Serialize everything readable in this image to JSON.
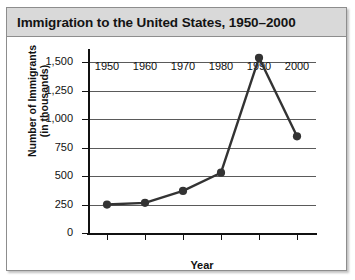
{
  "chart_data": {
    "type": "line",
    "title": "Immigration to the United States, 1950–2000",
    "xlabel": "Year",
    "ylabel_line1": "Number of Immigrants",
    "ylabel_line2": "(in thousands)",
    "x": [
      1950,
      1960,
      1970,
      1980,
      1990,
      2000
    ],
    "xtick_labels": [
      "1950",
      "1960",
      "1970",
      "1980",
      "1990",
      "2000"
    ],
    "values": [
      250,
      265,
      370,
      530,
      1540,
      850
    ],
    "ytick_values": [
      0,
      250,
      500,
      750,
      1000,
      1250,
      1500
    ],
    "ytick_labels": [
      "0",
      "250",
      "500",
      "750",
      "1,000",
      "1,250",
      "1,500"
    ],
    "xlim": [
      1945,
      2005
    ],
    "ylim": [
      0,
      1600
    ],
    "grid": "horizontal",
    "legend": "none",
    "line_color": "#333333",
    "marker_color": "#333333",
    "marker": "circle",
    "title_background": "#d9d9d9",
    "plot_background": "#ffffff"
  }
}
